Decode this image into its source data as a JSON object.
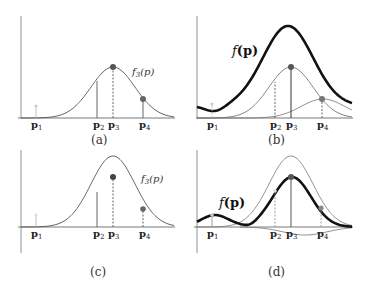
{
  "figure": {
    "panels": [
      {
        "id": "a",
        "caption": "(a)",
        "curve_label": "f",
        "curve_sub": "3",
        "curve_arg": "(p)"
      },
      {
        "id": "b",
        "caption": "(b)",
        "curve_label": "f",
        "curve_arg": "(p)"
      },
      {
        "id": "c",
        "caption": "(c)",
        "curve_label": "f",
        "curve_sub": "3",
        "curve_arg": "(p)"
      },
      {
        "id": "d",
        "caption": "(d)",
        "curve_label": "f",
        "curve_arg": "(p)"
      }
    ],
    "points": [
      {
        "name": "p",
        "sub": "1"
      },
      {
        "name": "p",
        "sub": "2"
      },
      {
        "name": "p",
        "sub": "3"
      },
      {
        "name": "p",
        "sub": "4"
      }
    ],
    "colors": {
      "curve": "#555555",
      "bold_curve": "#111111",
      "marker": "#555555",
      "faint": "#cccccc"
    }
  }
}
